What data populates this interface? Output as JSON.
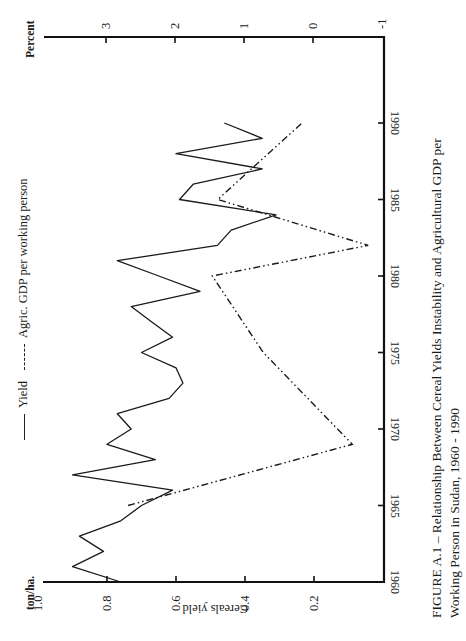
{
  "chart_data": {
    "type": "line",
    "orientation": "rotated-90",
    "title_line1": "FIGURE A.1 – Relationship Between Cereal Yields Instability and Agricultural GDP per",
    "title_line2": "Working Person in Sudan, 1960 - 1990",
    "xlabel": "",
    "x_ticks": [
      1960,
      1965,
      1970,
      1975,
      1980,
      1985,
      1990
    ],
    "x_range": [
      1960,
      1990
    ],
    "ylabel_left": "Cereals yield",
    "y_left_unit": "ton/ha.",
    "y_left_ticks": [
      "1.0",
      "0.8",
      "0.6",
      "0.4",
      "0.2"
    ],
    "y_left_range": [
      0,
      1.0
    ],
    "ylabel_right": "Percent",
    "y_right_ticks": [
      "3",
      "2",
      "1",
      "0",
      "-1"
    ],
    "y_right_range": [
      -1,
      3.5
    ],
    "legend": [
      {
        "label": "Yield",
        "style": "solid"
      },
      {
        "label": "Agric. GDP per working person",
        "style": "dash-dot-dot"
      }
    ],
    "grid": false,
    "series": [
      {
        "name": "Yield",
        "axis": "left",
        "x": [
          1960,
          1961,
          1962,
          1963,
          1964,
          1965,
          1966,
          1967,
          1968,
          1969,
          1970,
          1971,
          1972,
          1973,
          1974,
          1975,
          1976,
          1977,
          1978,
          1979,
          1980,
          1981,
          1982,
          1983,
          1984,
          1985,
          1986,
          1987,
          1988,
          1989,
          1990
        ],
        "values": [
          0.76,
          0.9,
          0.81,
          0.88,
          0.76,
          0.7,
          0.61,
          0.9,
          0.66,
          0.8,
          0.73,
          0.77,
          0.62,
          0.58,
          0.6,
          0.7,
          0.61,
          0.67,
          0.73,
          0.53,
          0.65,
          0.77,
          0.48,
          0.44,
          0.31,
          0.59,
          0.55,
          0.35,
          0.6,
          0.35,
          0.46
        ]
      },
      {
        "name": "Agric. GDP per working person",
        "axis": "right",
        "x": [
          1965,
          1969,
          1975,
          1980,
          1982,
          1985,
          1990
        ],
        "values": [
          2.68,
          -0.57,
          0.72,
          1.46,
          -0.8,
          1.38,
          0.16
        ]
      }
    ]
  }
}
